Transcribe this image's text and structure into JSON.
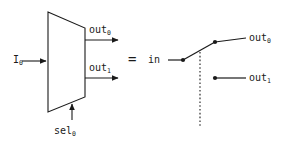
{
  "figure": {
    "type": "logic-diagram",
    "stroke_color": "#1a1a1a",
    "background_color": "#ffffff"
  },
  "equals_sign": {
    "label": "="
  },
  "mux": {
    "name": "demultiplexer-body",
    "input": {
      "label_base": "I",
      "label_sub": "0",
      "label": "I0"
    },
    "outputs": [
      {
        "label_base": "out",
        "label_sub": "0",
        "label": "out0"
      },
      {
        "label_base": "out",
        "label_sub": "1",
        "label": "out1"
      }
    ],
    "select": {
      "label_base": "sel",
      "label_sub": "0",
      "label": "sel0"
    }
  },
  "switch": {
    "name": "spdt-switch",
    "input": {
      "label": "in"
    },
    "outputs": [
      {
        "label_base": "out",
        "label_sub": "0",
        "label": "out0"
      },
      {
        "label_base": "out",
        "label_sub": "1",
        "label": "out1"
      }
    ],
    "control_line_style": "dotted",
    "throw_position": "upper"
  }
}
